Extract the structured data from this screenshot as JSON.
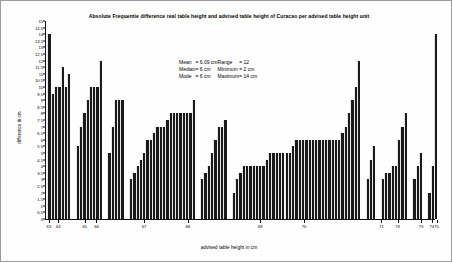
{
  "chart_data": {
    "type": "bar",
    "title": "Absolute Frequentie difference real table height and advised table height of Curacao per advised table height unit",
    "xlabel": "advised table height in cm",
    "ylabel": "difference in cm",
    "ylim": [
      0,
      15
    ],
    "ytick_step": 0.5,
    "ytick_labels": [
      "15",
      "14.5",
      "14",
      "13.5",
      "13",
      "12.5",
      "12",
      "11.5",
      "11",
      "10.5",
      "10",
      "9.5",
      "9",
      "8.5",
      "8",
      "7.5",
      "7",
      "6.5",
      "6",
      "5.5",
      "5",
      "4.5",
      "4",
      "3.5",
      "3",
      "2.5",
      "2",
      "1.5",
      "1",
      "0.5",
      "0"
    ],
    "grid": false,
    "legend": false,
    "bar_color": "#1a1a1a",
    "xtick_labels": [
      "63",
      "64",
      "65",
      "66",
      "67",
      "68",
      "69",
      "70",
      "71",
      "73",
      "73",
      "74",
      "75"
    ],
    "xtick_positions": [
      1.0,
      3.4,
      10.2,
      13.2,
      25.4,
      36.6,
      55.2,
      66.4,
      86.2,
      90.4,
      96.4,
      99.2,
      100.4
    ],
    "groups": [
      {
        "label": "63-64",
        "values": [
          14,
          9.5,
          10,
          10,
          11.5,
          10,
          11
        ]
      },
      {
        "label": "65-66",
        "values": [
          5.5,
          7,
          8,
          9,
          10,
          10,
          10,
          12
        ]
      },
      {
        "label": "67",
        "values": [
          5,
          7,
          9,
          9,
          9
        ]
      },
      {
        "label": "68",
        "values": [
          3,
          3.5,
          4,
          4.5,
          5,
          6,
          6,
          6.5,
          7,
          7,
          7,
          7.5,
          8,
          8,
          8,
          8,
          8,
          8,
          8,
          9
        ]
      },
      {
        "label": "69",
        "values": [
          3,
          3.5,
          4,
          5,
          6,
          7,
          7,
          7.5
        ]
      },
      {
        "label": "70",
        "values": [
          2,
          3,
          3.5,
          4,
          4,
          4,
          4,
          4,
          4,
          4,
          4.5,
          5,
          5,
          5,
          5,
          5,
          5,
          5,
          5.5,
          6,
          6,
          6,
          6,
          6,
          6,
          6,
          6,
          6,
          6,
          6,
          6,
          6,
          6,
          6.5,
          7,
          8,
          9,
          10,
          12
        ]
      },
      {
        "label": "71",
        "values": [
          3,
          4.5,
          5.5
        ]
      },
      {
        "label": "73a",
        "values": [
          3,
          3.5,
          3.5,
          4,
          4,
          6,
          7,
          8
        ]
      },
      {
        "label": "73b",
        "values": [
          3,
          4,
          5
        ]
      },
      {
        "label": "74-75",
        "values": [
          2,
          4,
          14
        ]
      }
    ],
    "statistics": {
      "rows": [
        {
          "label_left": "Mean",
          "value_left": "= 6.09 cm",
          "label_right": "Range",
          "value_right": "= 12"
        },
        {
          "label_left": "Median",
          "value_left": "= 6 cm",
          "label_right": "Minimum",
          "value_right": "=  2 cm"
        },
        {
          "label_left": "Mode",
          "value_left": "= 6 cm",
          "label_right": "Maximum",
          "value_right": "= 14 cm"
        }
      ]
    }
  }
}
